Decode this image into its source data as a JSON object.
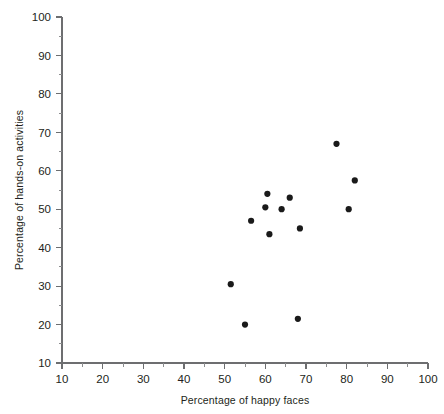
{
  "chart_data": {
    "type": "scatter",
    "title": "",
    "xlabel": "Percentage of happy faces",
    "ylabel": "Percentage of hands-on activities",
    "xlim": [
      10,
      100
    ],
    "ylim": [
      10,
      100
    ],
    "x_ticks": [
      10,
      20,
      30,
      40,
      50,
      60,
      70,
      80,
      90,
      100
    ],
    "y_ticks": [
      10,
      20,
      30,
      40,
      50,
      60,
      70,
      80,
      90,
      100
    ],
    "x_minor_ticks": [
      15,
      25,
      35,
      45,
      55,
      65,
      75,
      85,
      95
    ],
    "y_minor_ticks": [
      15,
      25,
      35,
      45,
      55,
      65,
      75,
      85,
      95
    ],
    "grid": false,
    "legend": false,
    "marker": "filled-circle",
    "marker_color": "#1a1a1a",
    "marker_size": 3.1,
    "points": [
      {
        "x": 51.5,
        "y": 30.5
      },
      {
        "x": 55.0,
        "y": 20.0
      },
      {
        "x": 56.5,
        "y": 47.0
      },
      {
        "x": 60.5,
        "y": 54.0
      },
      {
        "x": 60.0,
        "y": 50.5
      },
      {
        "x": 61.0,
        "y": 43.5
      },
      {
        "x": 64.0,
        "y": 50.0
      },
      {
        "x": 66.0,
        "y": 53.0
      },
      {
        "x": 68.5,
        "y": 45.0
      },
      {
        "x": 68.0,
        "y": 21.5
      },
      {
        "x": 77.5,
        "y": 67.0
      },
      {
        "x": 80.5,
        "y": 50.0
      },
      {
        "x": 82.0,
        "y": 57.5
      }
    ]
  },
  "axes": {
    "x_tick_labels": [
      "10",
      "20",
      "30",
      "40",
      "50",
      "60",
      "70",
      "80",
      "90",
      "100"
    ],
    "y_tick_labels": [
      "10",
      "20",
      "30",
      "40",
      "50",
      "60",
      "70",
      "80",
      "90",
      "100"
    ],
    "x_axis_title": "Percentage of happy faces",
    "y_axis_title": "Percentage of hands-on activities"
  }
}
